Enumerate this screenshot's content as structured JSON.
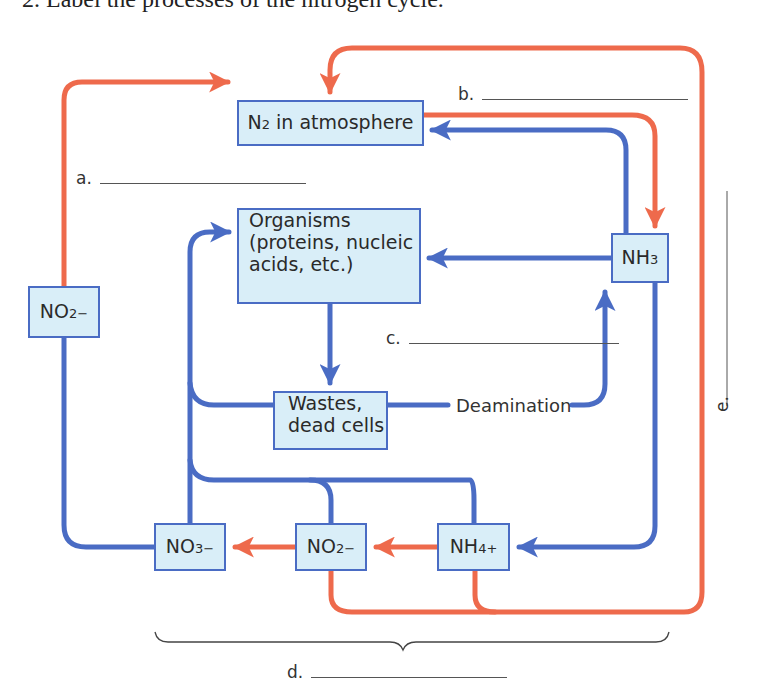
{
  "heading": "2.  Label the processes of the nitrogen cycle.",
  "colors": {
    "process_arrow_red": "#ee6a4c",
    "flow_arrow_blue": "#4a6cc4",
    "box_fill": "#d9eef8",
    "box_border": "#4a6cc4"
  },
  "nodes": {
    "n2_atmosphere": {
      "formula": "N",
      "sub": "2",
      "suffix": " in atmosphere"
    },
    "organisms": {
      "line1": "Organisms",
      "line2": "(proteins, nucleic",
      "line3": "acids, etc.)"
    },
    "nh3": {
      "formula": "NH",
      "sub": "3"
    },
    "no2_left": {
      "formula": "NO",
      "sub": "2",
      "sup": "−"
    },
    "wastes": {
      "line1": "Wastes,",
      "line2": "dead cells"
    },
    "no3_bottom": {
      "formula": "NO",
      "sub": "3",
      "sup": "−"
    },
    "no2_bottom": {
      "formula": "NO",
      "sub": "2",
      "sup": "−"
    },
    "nh4_bottom": {
      "formula": "NH",
      "sub": "4",
      "sup": "+"
    }
  },
  "process_labels": {
    "deamination": "Deamination"
  },
  "blanks": {
    "a": "a.",
    "b": "b.",
    "c": "c.",
    "d": "d.",
    "e": "e."
  }
}
